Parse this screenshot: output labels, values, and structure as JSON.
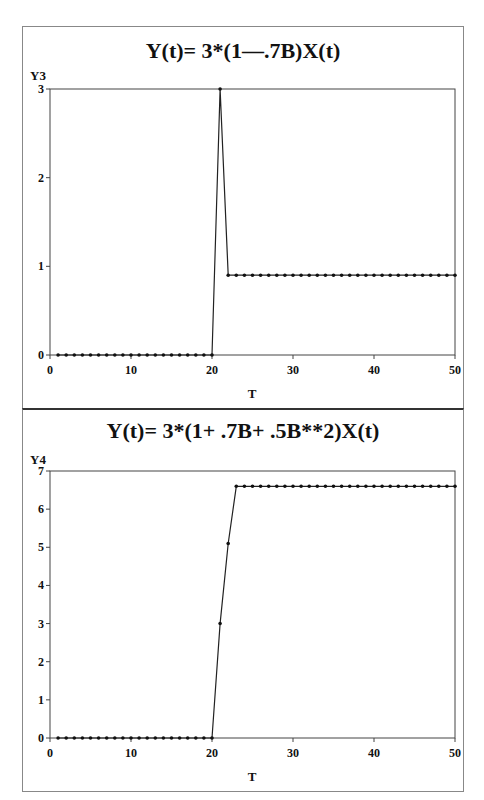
{
  "chart_data": [
    {
      "type": "line",
      "title": "Y(t)= 3*(1—.7B)X(t)",
      "xlabel": "T",
      "ylabel": "Y3",
      "xlim": [
        0,
        50
      ],
      "ylim": [
        0,
        3
      ],
      "xticks": [
        0,
        10,
        20,
        30,
        40,
        50
      ],
      "yticks": [
        0,
        1,
        2,
        3
      ],
      "grid": false,
      "markers": true,
      "x": [
        1,
        2,
        3,
        4,
        5,
        6,
        7,
        8,
        9,
        10,
        11,
        12,
        13,
        14,
        15,
        16,
        17,
        18,
        19,
        20,
        21,
        22,
        23,
        24,
        25,
        26,
        27,
        28,
        29,
        30,
        31,
        32,
        33,
        34,
        35,
        36,
        37,
        38,
        39,
        40,
        41,
        42,
        43,
        44,
        45,
        46,
        47,
        48,
        49,
        50
      ],
      "values": [
        0,
        0,
        0,
        0,
        0,
        0,
        0,
        0,
        0,
        0,
        0,
        0,
        0,
        0,
        0,
        0,
        0,
        0,
        0,
        0,
        3,
        0.9,
        0.9,
        0.9,
        0.9,
        0.9,
        0.9,
        0.9,
        0.9,
        0.9,
        0.9,
        0.9,
        0.9,
        0.9,
        0.9,
        0.9,
        0.9,
        0.9,
        0.9,
        0.9,
        0.9,
        0.9,
        0.9,
        0.9,
        0.9,
        0.9,
        0.9,
        0.9,
        0.9,
        0.9
      ]
    },
    {
      "type": "line",
      "title": "Y(t)= 3*(1+ .7B+ .5B**2)X(t)",
      "xlabel": "T",
      "ylabel": "Y4",
      "xlim": [
        0,
        50
      ],
      "ylim": [
        0,
        7
      ],
      "xticks": [
        0,
        10,
        20,
        30,
        40,
        50
      ],
      "yticks": [
        0,
        1,
        2,
        3,
        4,
        5,
        6,
        7
      ],
      "grid": false,
      "markers": true,
      "x": [
        1,
        2,
        3,
        4,
        5,
        6,
        7,
        8,
        9,
        10,
        11,
        12,
        13,
        14,
        15,
        16,
        17,
        18,
        19,
        20,
        21,
        22,
        23,
        24,
        25,
        26,
        27,
        28,
        29,
        30,
        31,
        32,
        33,
        34,
        35,
        36,
        37,
        38,
        39,
        40,
        41,
        42,
        43,
        44,
        45,
        46,
        47,
        48,
        49,
        50
      ],
      "values": [
        0,
        0,
        0,
        0,
        0,
        0,
        0,
        0,
        0,
        0,
        0,
        0,
        0,
        0,
        0,
        0,
        0,
        0,
        0,
        0,
        3,
        5.1,
        6.6,
        6.6,
        6.6,
        6.6,
        6.6,
        6.6,
        6.6,
        6.6,
        6.6,
        6.6,
        6.6,
        6.6,
        6.6,
        6.6,
        6.6,
        6.6,
        6.6,
        6.6,
        6.6,
        6.6,
        6.6,
        6.6,
        6.6,
        6.6,
        6.6,
        6.6,
        6.6,
        6.6
      ]
    }
  ],
  "colors": {
    "line": "#222222",
    "frame": "#888888",
    "text": "#111111"
  }
}
